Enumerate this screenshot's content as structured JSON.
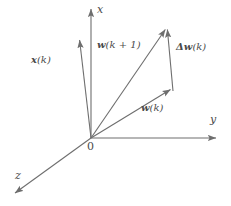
{
  "figure": {
    "background_color": "#ffffff",
    "line_color": "#6e6e6e",
    "text_color": "#4a4a4a"
  },
  "axes": [
    {
      "id": "x",
      "label": "x",
      "from": [
        91,
        138
      ],
      "to": [
        91,
        7
      ],
      "label_pos": [
        97,
        6
      ]
    },
    {
      "id": "y",
      "label": "y",
      "from": [
        91,
        138
      ],
      "to": [
        218,
        138
      ],
      "label_pos": [
        211,
        116
      ]
    },
    {
      "id": "z",
      "label": "z",
      "from": [
        91,
        138
      ],
      "to": [
        13,
        195
      ],
      "label_pos": [
        16,
        172
      ]
    }
  ],
  "vectors": [
    {
      "id": "xk",
      "label_parts": {
        "bold": "x",
        "rest": "(k)"
      },
      "from": [
        91,
        138
      ],
      "to": [
        79,
        37
      ],
      "label_pos": [
        33,
        56
      ]
    },
    {
      "id": "wk1",
      "label_parts": {
        "bold": "w",
        "rest": "(k + 1)"
      },
      "from": [
        91,
        138
      ],
      "to": [
        167,
        26
      ],
      "label_pos": [
        98,
        41
      ]
    },
    {
      "id": "wk",
      "label_parts": {
        "bold": "w",
        "rest": "(k)"
      },
      "from": [
        91,
        138
      ],
      "to": [
        173,
        91
      ],
      "label_pos": [
        142,
        104
      ]
    },
    {
      "id": "dwk",
      "label_parts": {
        "bold": "Δw",
        "rest": "(k)"
      },
      "from": [
        173,
        91
      ],
      "to": [
        167,
        26
      ],
      "label_pos": [
        177,
        43
      ]
    }
  ],
  "origin": {
    "label": "0",
    "pos": [
      88,
      142
    ]
  }
}
